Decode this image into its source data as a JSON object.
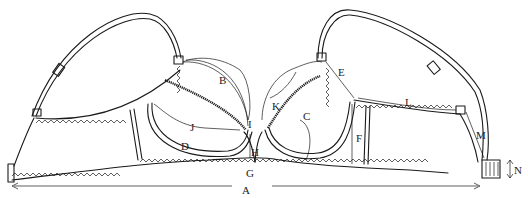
{
  "diagram": {
    "type": "technical garment measurement diagram",
    "colors": {
      "line": "#1a1a1a",
      "background": "#ffffff"
    },
    "labels": [
      {
        "id": "A",
        "text": "A",
        "meaning": "total band length (arrows spanning full width)"
      },
      {
        "id": "B",
        "text": "B",
        "meaning": "cup curve (left cup, strap to center)"
      },
      {
        "id": "C",
        "text": "C",
        "meaning": "point on lower cup seam (right cup)"
      },
      {
        "id": "D",
        "text": "D",
        "meaning": "underwire curve (left cup)"
      },
      {
        "id": "E",
        "text": "E",
        "meaning": "cup upper side edge (right cup)"
      },
      {
        "id": "F",
        "text": "F",
        "meaning": "side height at cup"
      },
      {
        "id": "G",
        "text": "G",
        "meaning": "center gore bottom"
      },
      {
        "id": "H",
        "text": "H",
        "meaning": "center gore height"
      },
      {
        "id": "I",
        "text": "I",
        "meaning": "center gore top width"
      },
      {
        "id": "J",
        "text": "J",
        "meaning": "cup width across (left cup)"
      },
      {
        "id": "K",
        "text": "K",
        "meaning": "cup depth (right cup)"
      },
      {
        "id": "L",
        "text": "L",
        "meaning": "wing upper edge"
      },
      {
        "id": "M",
        "text": "M",
        "meaning": "strap-to-back distance"
      },
      {
        "id": "N",
        "text": "N",
        "meaning": "hook-and-eye closure height"
      }
    ]
  }
}
